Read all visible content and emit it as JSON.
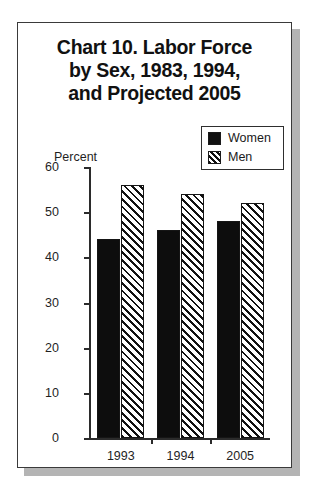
{
  "card": {
    "title_lines": [
      "Chart 10. Labor Force",
      "by Sex, 1983, 1994,",
      "and Projected 2005"
    ]
  },
  "legend": {
    "items": [
      {
        "label": "Women",
        "swatch": "solid-black-swatch"
      },
      {
        "label": "Men",
        "swatch": "diagonal-hatch-swatch"
      }
    ]
  },
  "chart_data": {
    "type": "bar",
    "title": "Chart 10. Labor Force by Sex, 1983, 1994, and Projected 2005",
    "xlabel": "",
    "ylabel": "Percent",
    "ylim": [
      0,
      60
    ],
    "yticks": [
      0,
      10,
      20,
      30,
      40,
      50,
      60
    ],
    "ytick_labels": [
      "0",
      "10",
      "20",
      "30",
      "40",
      "50",
      "60"
    ],
    "grid": false,
    "legend_position": "top-right",
    "categories": [
      "1993",
      "1994",
      "2005"
    ],
    "series": [
      {
        "name": "Women",
        "values": [
          44,
          46,
          48
        ]
      },
      {
        "name": "Men",
        "values": [
          56,
          54,
          52
        ]
      }
    ]
  }
}
